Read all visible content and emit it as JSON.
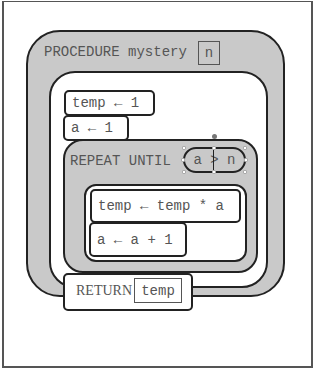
{
  "procedure": {
    "keyword": "PROCEDURE",
    "name": "mystery",
    "parameter": "n"
  },
  "statements": [
    {
      "text": "temp ← 1"
    },
    {
      "text": "a ← 1"
    }
  ],
  "repeat_block": {
    "label": "REPEAT UNTIL",
    "condition": {
      "left": "a",
      "operator": ">",
      "right": "n",
      "text": "a > n"
    },
    "body": [
      {
        "text": "temp ← temp * a"
      },
      {
        "text": "a ← a + 1"
      }
    ]
  },
  "return_block": {
    "keyword": "RETURN",
    "value": "temp"
  },
  "colors": {
    "block_fill": "#c9c9c9",
    "block_border": "#222222",
    "text": "#555555",
    "background": "#ffffff"
  }
}
